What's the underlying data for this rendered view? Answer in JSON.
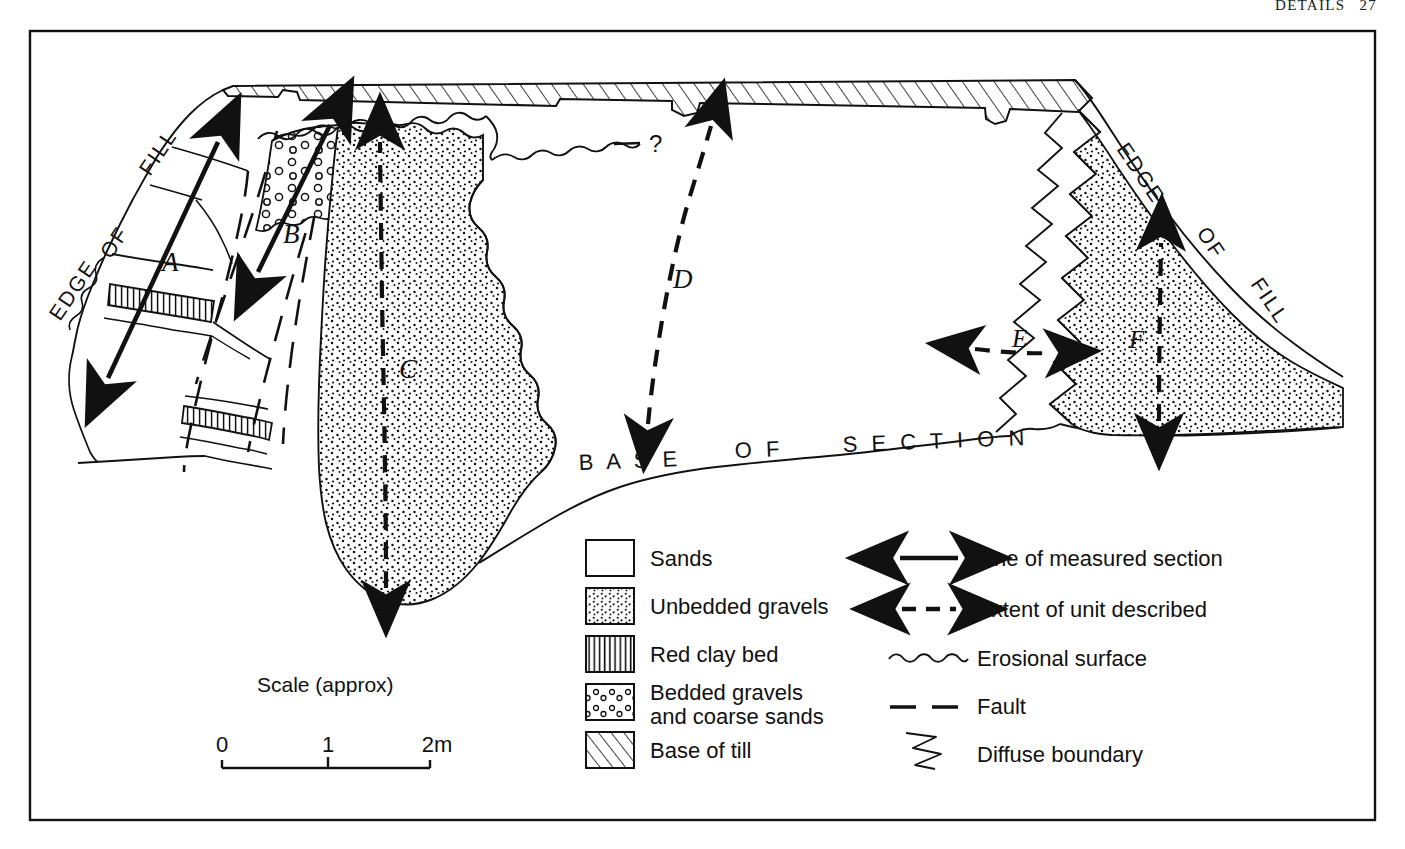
{
  "running_head": {
    "title": "DETAILS",
    "page": "27"
  },
  "figure": {
    "annotations": {
      "edge_of_fill_left": "EDGE OF FILL",
      "edge_of_fill_right": "EDGE OF FILL",
      "base_of_section": "BASE OF SECTION",
      "query": "?"
    },
    "section_labels": [
      {
        "id": "A",
        "label": "A",
        "kind": "line-of-measured-section"
      },
      {
        "id": "B",
        "label": "B",
        "kind": "line-of-measured-section"
      },
      {
        "id": "C",
        "label": "C",
        "kind": "extent-of-unit-described"
      },
      {
        "id": "D",
        "label": "D",
        "kind": "extent-of-unit-described"
      },
      {
        "id": "E",
        "label": "E",
        "kind": "extent-of-unit-described"
      },
      {
        "id": "F",
        "label": "F",
        "kind": "extent-of-unit-described"
      }
    ]
  },
  "scale": {
    "caption": "Scale (approx)",
    "ticks": [
      "0",
      "1",
      "2m"
    ]
  },
  "legend": {
    "patterns": [
      {
        "swatch": "sands-swatch",
        "label": "Sands"
      },
      {
        "swatch": "unbedded-gravels-swatch",
        "label": "Unbedded gravels"
      },
      {
        "swatch": "red-clay-bed-swatch",
        "label": "Red clay bed"
      },
      {
        "swatch": "bedded-gravels-swatch",
        "label": "Bedded gravels",
        "label2": "and coarse sands"
      },
      {
        "swatch": "base-of-till-swatch",
        "label": "Base of till"
      }
    ],
    "symbols": [
      {
        "symbol": "solid-double-arrow-icon",
        "label": "Line of measured section"
      },
      {
        "symbol": "dashed-double-arrow-icon",
        "label": "Extent of unit described"
      },
      {
        "symbol": "wavy-line-icon",
        "label": "Erosional surface"
      },
      {
        "symbol": "dashed-line-icon",
        "label": "Fault"
      },
      {
        "symbol": "zigzag-line-icon",
        "label": "Diffuse boundary"
      }
    ]
  },
  "colors": {
    "ink": "#111111",
    "paper": "#ffffff"
  }
}
